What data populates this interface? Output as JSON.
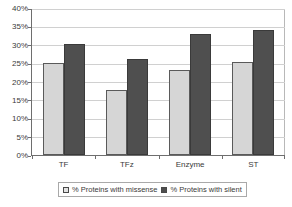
{
  "chart_data": {
    "type": "bar",
    "title": "",
    "xlabel": "",
    "ylabel": "",
    "categories": [
      "TF",
      "TFz",
      "Enzyme",
      "ST"
    ],
    "series": [
      {
        "name": "% Proteins with missense",
        "color": "#d6d6d6",
        "values": [
          25.0,
          17.8,
          23.0,
          25.2
        ]
      },
      {
        "name": "% Proteins with silent",
        "color": "#4f4f4f",
        "values": [
          30.3,
          26.0,
          32.8,
          34.0
        ]
      }
    ],
    "ylim": [
      0,
      40
    ],
    "ytick_values": [
      0,
      5,
      10,
      15,
      20,
      25,
      30,
      35,
      40
    ],
    "ytick_labels": [
      "0%",
      "5%",
      "10%",
      "15%",
      "20%",
      "25%",
      "30%",
      "35%",
      "40%"
    ],
    "grid": true,
    "legend_position": "bottom"
  }
}
